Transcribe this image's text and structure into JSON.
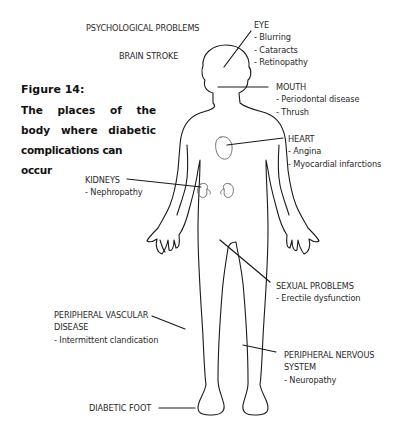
{
  "figure": {
    "title": "Figure 14:",
    "caption_lines": [
      "The places of the",
      "body where diabetic",
      "complications can occur"
    ]
  },
  "labels": {
    "psychological": {
      "heading": "PSYCHOLOGICAL PROBLEMS"
    },
    "brain": {
      "heading": "BRAIN STROKE"
    },
    "eye": {
      "heading": "EYE",
      "items": [
        "- Blurring",
        "- Cataracts",
        "- Retinopathy"
      ]
    },
    "mouth": {
      "heading": "MOUTH",
      "items": [
        "- Periodontal disease",
        "- Thrush"
      ]
    },
    "heart": {
      "heading": "HEART",
      "items": [
        "- Angina",
        "- Myocardial infarctions"
      ]
    },
    "kidneys": {
      "heading": "KIDNEYS",
      "items": [
        "- Nephropathy"
      ]
    },
    "sexual": {
      "heading": "SEXUAL PROBLEMS",
      "items": [
        "- Erectile dysfunction"
      ]
    },
    "pvd": {
      "heading_lines": [
        "PERIPHERAL VASCULAR",
        "DISEASE"
      ],
      "items": [
        "- Intermittent clandication"
      ]
    },
    "pns": {
      "heading_lines": [
        "PERIPHERAL NERVOUS",
        "SYSTEM"
      ],
      "items": [
        "- Neuropathy"
      ]
    },
    "foot": {
      "heading": "DIABETIC FOOT"
    }
  },
  "colors": {
    "line": "#1a1a1a",
    "text": "#2a2a2a",
    "background": "#ffffff"
  }
}
